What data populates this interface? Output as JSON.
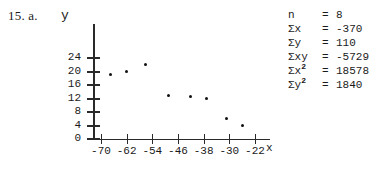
{
  "problem": {
    "label": "15. a."
  },
  "axes": {
    "y_label": "y",
    "x_label": "x",
    "y_ticks": [
      24,
      20,
      16,
      12,
      8,
      4,
      0
    ],
    "x_ticks": [
      -70,
      -62,
      -54,
      -46,
      -38,
      -30,
      -22
    ]
  },
  "stats": {
    "rows": [
      {
        "symbol": "n",
        "sup": "",
        "eq": "=",
        "value": "8"
      },
      {
        "symbol": "Σx",
        "sup": "",
        "eq": "=",
        "value": "-370"
      },
      {
        "symbol": "Σy",
        "sup": "",
        "eq": "=",
        "value": "110"
      },
      {
        "symbol": "Σxy",
        "sup": "",
        "eq": "=",
        "value": "-5729"
      },
      {
        "symbol": "Σx",
        "sup": "2",
        "eq": "=",
        "value": "18578"
      },
      {
        "symbol": "Σy",
        "sup": "2",
        "eq": "=",
        "value": "1840"
      }
    ],
    "n_label": "n",
    "n_value": "8",
    "sum_x_label": "Σx",
    "sum_x_value": "-370",
    "sum_y_label": "Σy",
    "sum_y_value": "110",
    "sum_xy_label": "Σxy",
    "sum_xy_value": "-5729",
    "sum_x2_label": "Σx²",
    "sum_x2_value": "18578",
    "sum_y2_label": "Σy²",
    "sum_y2_value": "1840"
  },
  "chart_data": {
    "type": "scatter",
    "title": "",
    "xlabel": "x",
    "ylabel": "y",
    "xlim": [
      -74,
      -18
    ],
    "ylim": [
      0,
      26
    ],
    "xticks": [
      -70,
      -62,
      -54,
      -46,
      -38,
      -30,
      -22
    ],
    "yticks": [
      0,
      4,
      8,
      12,
      16,
      20,
      24
    ],
    "grid": false,
    "legend": null,
    "points": [
      {
        "x": -67,
        "y": 19
      },
      {
        "x": -62,
        "y": 20
      },
      {
        "x": -56,
        "y": 22
      },
      {
        "x": -49,
        "y": 13
      },
      {
        "x": -42,
        "y": 12.5
      },
      {
        "x": -37,
        "y": 12
      },
      {
        "x": -31,
        "y": 6
      },
      {
        "x": -26,
        "y": 4
      }
    ]
  }
}
